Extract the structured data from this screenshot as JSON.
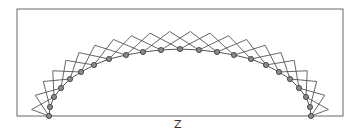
{
  "diagram": {
    "label": "Z",
    "frame": {
      "x": 17,
      "y": 9,
      "width": 326,
      "height": 107
    },
    "stroke_color": "#555555",
    "node_stroke": "#333333",
    "node_fill": "#8a8a8a",
    "node_radius": 2.6,
    "zigzag_offset": 18,
    "arc_nodes": [
      [
        49,
        116
      ],
      [
        50,
        107
      ],
      [
        54,
        97
      ],
      [
        61,
        88
      ],
      [
        70,
        79
      ],
      [
        81,
        72
      ],
      [
        94,
        65
      ],
      [
        109,
        59
      ],
      [
        126,
        55
      ],
      [
        143,
        52
      ],
      [
        161,
        50
      ],
      [
        180,
        49
      ],
      [
        199,
        50
      ],
      [
        217,
        52
      ],
      [
        234,
        55
      ],
      [
        251,
        59
      ],
      [
        266,
        65
      ],
      [
        279,
        72
      ],
      [
        290,
        79
      ],
      [
        299,
        88
      ],
      [
        306,
        97
      ],
      [
        310,
        107
      ],
      [
        311,
        116
      ]
    ]
  }
}
